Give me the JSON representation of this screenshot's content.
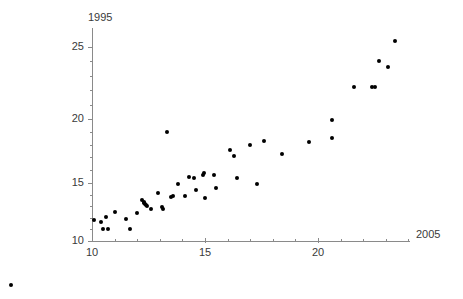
{
  "chart_data": {
    "type": "scatter",
    "title": "",
    "xlabel": "2005",
    "ylabel": "1995",
    "xlim": [
      10,
      24.1
    ],
    "ylim": [
      9.2,
      25.9
    ],
    "grid": false,
    "legend": null,
    "x_ticks_major": [
      15,
      20
    ],
    "x_tick_labels_major": [
      "15",
      "20"
    ],
    "x_ticks_minor": [
      11,
      12,
      13,
      14,
      16,
      17,
      18,
      19,
      21,
      22,
      23,
      24
    ],
    "y_ticks_major": [
      10,
      15,
      20,
      25
    ],
    "y_tick_labels_major": [
      "10",
      "15",
      "20",
      "25"
    ],
    "y_ticks_minor": [
      11,
      12,
      13,
      14,
      16,
      17,
      18,
      19,
      21,
      22,
      23,
      24
    ],
    "origin_tick_label": "10",
    "marker": "filled-circle",
    "marker_color": "#000000",
    "marker_size_px": 4,
    "axis_color": "#8a8a8a",
    "points": [
      [
        10.1,
        11.8
      ],
      [
        10.5,
        11.0
      ],
      [
        10.7,
        11.0
      ],
      [
        10.6,
        12.1
      ],
      [
        10.4,
        11.6
      ],
      [
        11.0,
        12.5
      ],
      [
        11.5,
        11.9
      ],
      [
        11.7,
        11.0
      ],
      [
        12.0,
        12.4
      ],
      [
        12.2,
        13.5
      ],
      [
        12.3,
        13.3
      ],
      [
        12.3,
        13.4
      ],
      [
        12.35,
        13.2
      ],
      [
        12.4,
        13.1
      ],
      [
        12.45,
        13.0
      ],
      [
        12.6,
        12.8
      ],
      [
        12.9,
        14.1
      ],
      [
        13.1,
        12.9
      ],
      [
        13.15,
        12.8
      ],
      [
        13.5,
        13.8
      ],
      [
        13.6,
        13.9
      ],
      [
        13.3,
        19.0
      ],
      [
        13.8,
        14.9
      ],
      [
        14.1,
        13.9
      ],
      [
        14.3,
        15.5
      ],
      [
        14.5,
        15.4
      ],
      [
        14.6,
        14.4
      ],
      [
        14.9,
        15.6
      ],
      [
        14.95,
        15.8
      ],
      [
        15.0,
        13.7
      ],
      [
        15.4,
        15.6
      ],
      [
        15.5,
        14.6
      ],
      [
        16.1,
        17.6
      ],
      [
        16.3,
        17.1
      ],
      [
        16.4,
        15.4
      ],
      [
        17.0,
        18.0
      ],
      [
        17.3,
        14.9
      ],
      [
        17.6,
        18.3
      ],
      [
        18.4,
        17.3
      ],
      [
        19.6,
        18.2
      ],
      [
        20.6,
        18.5
      ],
      [
        20.6,
        19.9
      ],
      [
        21.6,
        22.2
      ],
      [
        22.4,
        22.2
      ],
      [
        22.5,
        22.2
      ],
      [
        22.7,
        24.0
      ],
      [
        23.1,
        23.6
      ],
      [
        23.4,
        25.4
      ]
    ],
    "outlier_points": [
      [
        6.4,
        6.2
      ]
    ]
  }
}
